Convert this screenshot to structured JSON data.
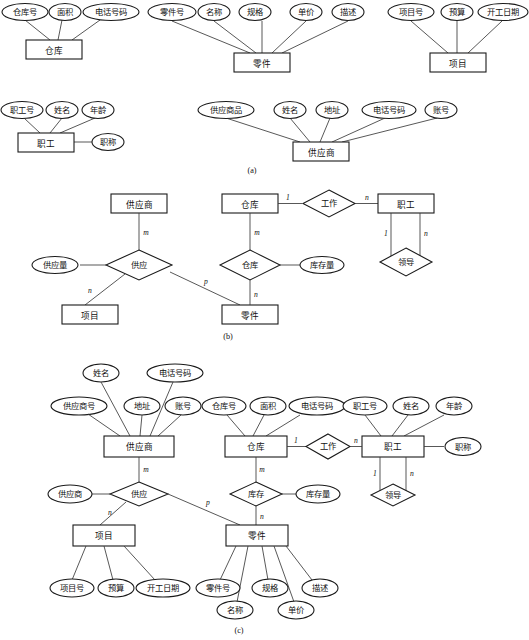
{
  "figure": {
    "sections": [
      {
        "id": "a",
        "label": "(a)"
      },
      {
        "id": "b",
        "label": "(b)"
      },
      {
        "id": "c",
        "label": "(c)"
      }
    ]
  },
  "section_a": {
    "caption": "(a)",
    "groups": [
      {
        "entity": "仓库",
        "attributes": [
          "仓库号",
          "面积",
          "电话号码"
        ]
      },
      {
        "entity": "零件",
        "attributes": [
          "零件号",
          "名称",
          "规格",
          "单价",
          "描述"
        ]
      },
      {
        "entity": "项目",
        "attributes": [
          "项目号",
          "预算",
          "开工日期"
        ]
      },
      {
        "entity": "职工",
        "attributes": [
          "职工号",
          "姓名",
          "年龄",
          "职称"
        ]
      },
      {
        "entity": "供应商",
        "attributes": [
          "供应商品",
          "姓名",
          "地址",
          "电话号码",
          "账号"
        ]
      }
    ]
  },
  "section_b": {
    "caption": "(b)",
    "entities": [
      "供应商",
      "项目",
      "零件",
      "仓库",
      "职工"
    ],
    "relationships": [
      {
        "name": "供应",
        "attribute": "供应量",
        "cardinalities": [
          "m",
          "n",
          "p"
        ]
      },
      {
        "name": "工作",
        "attribute": "",
        "cardinalities": [
          "1",
          "n"
        ]
      },
      {
        "name": "仓库",
        "attribute": "库存量",
        "cardinalities": [
          "m",
          "n"
        ]
      },
      {
        "name": "领导",
        "attribute": "",
        "cardinalities": [
          "1",
          "n"
        ]
      }
    ],
    "labels": {
      "supplier": "供应商",
      "supply_rel": "供应",
      "supply_qty": "供应量",
      "project": "项目",
      "part": "零件",
      "warehouse": "仓库",
      "work_rel": "工作",
      "employee": "职工",
      "stock_rel": "仓库",
      "stock_qty": "库存量",
      "lead_rel": "领导",
      "m": "m",
      "n": "n",
      "p": "p",
      "one": "1"
    }
  },
  "section_c": {
    "caption": "(c)",
    "labels": {
      "supplier": "供应商",
      "supplier_attrs": [
        "供应商号",
        "姓名",
        "地址",
        "电话号码",
        "账号"
      ],
      "warehouse": "仓库",
      "warehouse_attrs": [
        "仓库号",
        "面积",
        "电话号码"
      ],
      "employee": "职工",
      "employee_attrs": [
        "职工号",
        "姓名",
        "年龄",
        "职称"
      ],
      "project": "项目",
      "project_attrs": [
        "项目号",
        "预算",
        "开工日期"
      ],
      "part": "零件",
      "part_attrs": [
        "零件号",
        "名称",
        "规格",
        "单价",
        "描述"
      ],
      "supply_rel": "供应",
      "supply_qty": "供应商",
      "work_rel": "工作",
      "stock_rel": "库存",
      "stock_qty": "库存量",
      "lead_rel": "领导",
      "m": "m",
      "n": "n",
      "p": "p",
      "one": "1"
    }
  },
  "colors": {
    "stroke": "#1a1a1a",
    "edge": "#3a3a3a",
    "fill": "#ffffff",
    "text": "#111111"
  }
}
